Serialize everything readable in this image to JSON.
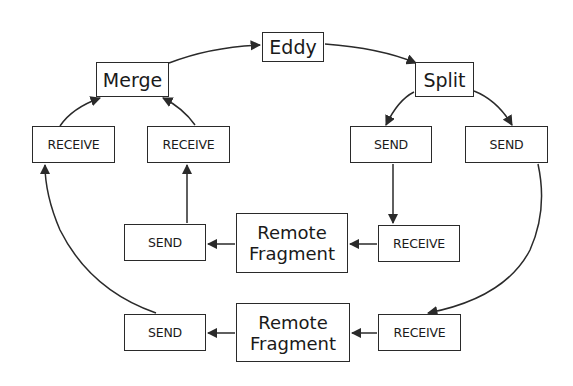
{
  "diagram": {
    "nodes": {
      "eddy": "Eddy",
      "merge": "Merge",
      "split": "Split",
      "receive_left": "RECEIVE",
      "receive_mid": "RECEIVE",
      "send_split_left": "SEND",
      "send_split_right": "SEND",
      "send_frag1": "SEND",
      "fragment1_line1": "Remote",
      "fragment1_line2": "Fragment",
      "receive_frag1": "RECEIVE",
      "send_frag2": "SEND",
      "fragment2_line1": "Remote",
      "fragment2_line2": "Fragment",
      "receive_frag2": "RECEIVE"
    },
    "edges": [
      {
        "from": "merge",
        "to": "eddy"
      },
      {
        "from": "eddy",
        "to": "split"
      },
      {
        "from": "split",
        "to": "send_split_left"
      },
      {
        "from": "split",
        "to": "send_split_right"
      },
      {
        "from": "send_split_left",
        "to": "receive_frag1"
      },
      {
        "from": "receive_frag1",
        "to": "fragment1"
      },
      {
        "from": "fragment1",
        "to": "send_frag1"
      },
      {
        "from": "send_frag1",
        "to": "receive_mid"
      },
      {
        "from": "receive_mid",
        "to": "merge"
      },
      {
        "from": "send_split_right",
        "to": "receive_frag2"
      },
      {
        "from": "receive_frag2",
        "to": "fragment2"
      },
      {
        "from": "fragment2",
        "to": "send_frag2"
      },
      {
        "from": "send_frag2",
        "to": "receive_left"
      },
      {
        "from": "receive_left",
        "to": "merge"
      }
    ],
    "colors": {
      "stroke": "#2a2a2a",
      "background": "#ffffff",
      "text": "#1a1a1a"
    }
  }
}
